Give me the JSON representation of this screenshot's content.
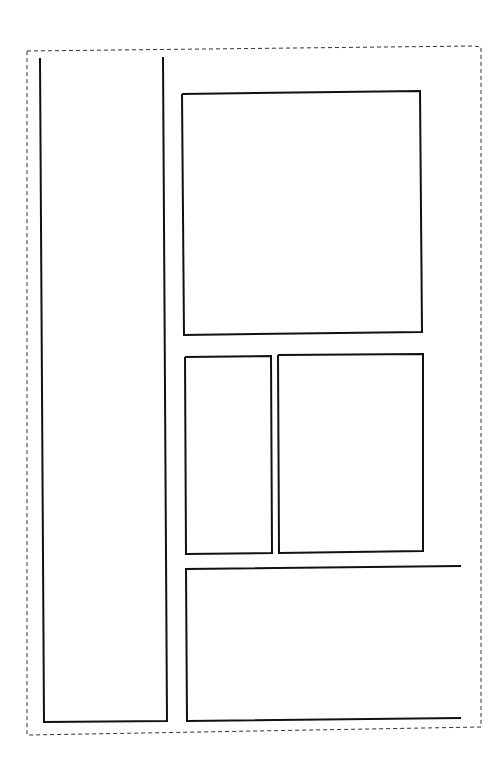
{
  "diagram": {
    "type": "layout-wireframe",
    "canvas": {
      "width": 501,
      "height": 773,
      "background": "#ffffff"
    },
    "outer_frame": {
      "style": "dashed",
      "color": "#333333",
      "points": [
        [
          27,
          51
        ],
        [
          474,
          46
        ],
        [
          481,
          47
        ],
        [
          481,
          727
        ],
        [
          30,
          735
        ],
        [
          27,
          735
        ],
        [
          27,
          51
        ]
      ]
    },
    "panels": [
      {
        "id": "left-column-panel",
        "style": "solid",
        "color": "#111111",
        "points": [
          [
            40,
            58
          ],
          [
            44,
            722
          ],
          [
            167,
            721
          ],
          [
            163,
            57
          ]
        ]
      },
      {
        "id": "top-right-panel",
        "style": "solid",
        "color": "#111111",
        "points": [
          [
            182,
            94
          ],
          [
            420,
            91
          ],
          [
            422,
            332
          ],
          [
            184,
            335
          ],
          [
            182,
            94
          ]
        ]
      },
      {
        "id": "middle-left-panel",
        "style": "solid",
        "color": "#111111",
        "points": [
          [
            185,
            357
          ],
          [
            271,
            356
          ],
          [
            272,
            553
          ],
          [
            186,
            554
          ],
          [
            185,
            357
          ]
        ]
      },
      {
        "id": "middle-right-panel",
        "style": "solid",
        "color": "#111111",
        "points": [
          [
            278,
            355
          ],
          [
            423,
            354
          ],
          [
            423,
            551
          ],
          [
            279,
            553
          ],
          [
            278,
            355
          ]
        ]
      },
      {
        "id": "bottom-wide-panel",
        "style": "solid",
        "color": "#111111",
        "points": [
          [
            461,
            566
          ],
          [
            186,
            569
          ],
          [
            187,
            721
          ],
          [
            461,
            718
          ]
        ]
      }
    ]
  }
}
